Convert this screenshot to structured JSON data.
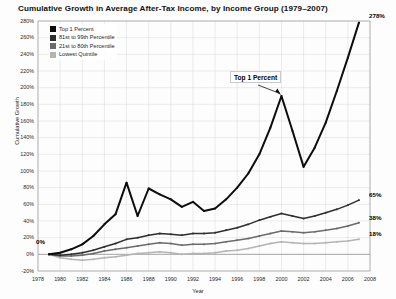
{
  "chart_data": {
    "type": "line",
    "title": "Cumulative Growth in Average After-Tax Income, by Income Group (1979–2007)",
    "xlabel": "Year",
    "ylabel": "Cumulative Growth",
    "xlim": [
      1978,
      2008
    ],
    "ylim": [
      -20,
      280
    ],
    "ytick_step": 20,
    "grid": true,
    "legend_position": "top-left",
    "x": [
      1979,
      1980,
      1981,
      1982,
      1983,
      1984,
      1985,
      1986,
      1987,
      1988,
      1989,
      1990,
      1991,
      1992,
      1993,
      1994,
      1995,
      1996,
      1997,
      1998,
      1999,
      2000,
      2001,
      2002,
      2003,
      2004,
      2005,
      2006,
      2007
    ],
    "xtick_labels": [
      "1978",
      "1980",
      "1982",
      "1984",
      "1986",
      "1988",
      "1990",
      "1992",
      "1994",
      "1996",
      "1998",
      "2000",
      "2002",
      "2004",
      "2006",
      "2008"
    ],
    "ytick_labels": [
      "280%",
      "260%",
      "240%",
      "220%",
      "200%",
      "180%",
      "160%",
      "140%",
      "120%",
      "100%",
      "80%",
      "60%",
      "40%",
      "20%",
      "0%",
      "-20%"
    ],
    "series": [
      {
        "name": "Top 1 Percent",
        "color": "#0d0d0d",
        "end_label": "278%",
        "values": [
          0,
          2,
          6,
          12,
          22,
          36,
          48,
          86,
          46,
          79,
          72,
          66,
          57,
          63,
          52,
          55,
          66,
          80,
          97,
          120,
          152,
          190,
          148,
          105,
          128,
          158,
          196,
          236,
          278
        ]
      },
      {
        "name": "81st to 99th Percentile",
        "color": "#2e2e2e",
        "end_label": "65%",
        "values": [
          0,
          -1,
          0,
          2,
          5,
          9,
          13,
          18,
          20,
          23,
          25,
          24,
          23,
          25,
          25,
          26,
          29,
          32,
          36,
          41,
          45,
          49,
          46,
          43,
          46,
          50,
          54,
          59,
          65
        ]
      },
      {
        "name": "21st to 80th Percentile",
        "color": "#6b6b6b",
        "end_label": "38%",
        "values": [
          0,
          -2,
          -2,
          -1,
          1,
          4,
          6,
          8,
          10,
          12,
          14,
          13,
          11,
          12,
          12,
          13,
          15,
          17,
          19,
          22,
          25,
          28,
          27,
          26,
          27,
          29,
          31,
          34,
          38
        ]
      },
      {
        "name": "Lowest Quintile",
        "color": "#b4b4b4",
        "end_label": "18%",
        "values": [
          0,
          -4,
          -6,
          -7,
          -6,
          -4,
          -3,
          -1,
          1,
          2,
          3,
          2,
          0,
          1,
          1,
          2,
          4,
          5,
          7,
          10,
          13,
          15,
          14,
          13,
          13,
          14,
          15,
          16,
          18
        ]
      }
    ],
    "annotations": [
      {
        "name": "top-1-percent-callout",
        "text": "Top 1 Percent",
        "points_to_year": 2000
      },
      {
        "name": "origin-value-label",
        "text": "0%"
      }
    ]
  }
}
